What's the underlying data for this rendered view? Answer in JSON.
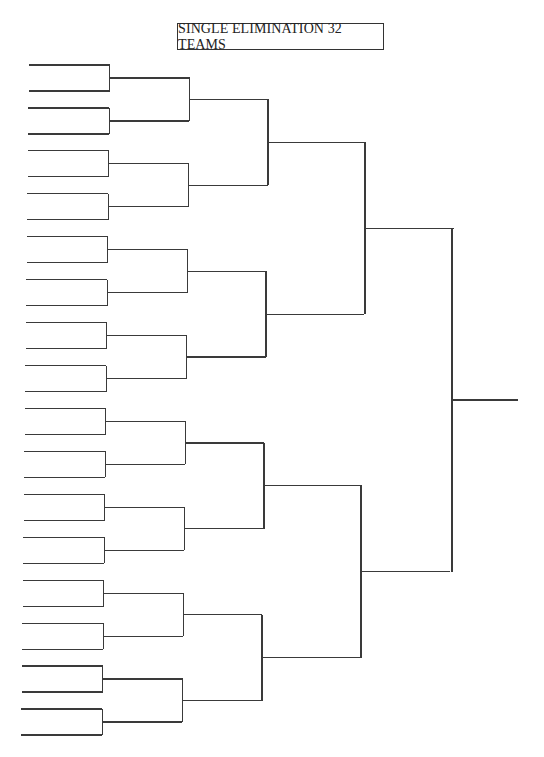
{
  "title": "SINGLE ELIMINATION 32 TEAMS",
  "colors": {
    "line": "#3a3a3a",
    "background": "#ffffff",
    "text": "#222222"
  },
  "bracket": {
    "teams": 32,
    "rounds": 5,
    "round_labels": [],
    "slots": []
  }
}
